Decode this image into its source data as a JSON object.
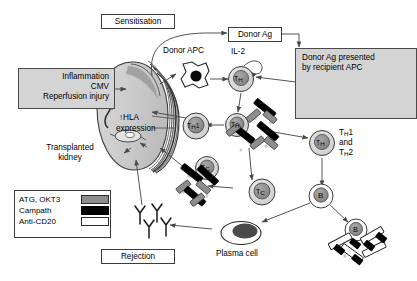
{
  "figure": {
    "type": "biomedical-pathway-diagram"
  },
  "boxes": {
    "sensitisation": {
      "label": "Sensitisation"
    },
    "donor_ag": {
      "label": "Donor Ag"
    },
    "rejection": {
      "label": "Rejection"
    }
  },
  "gray_panels": {
    "stimulus": {
      "line1": "Inflammation",
      "line2": "CMV",
      "line3": "Reperfusion injury"
    },
    "recipient_apc": {
      "line1": "Donor Ag presented",
      "line2": "by recipient APC",
      "icon": "apc-cell-icon"
    }
  },
  "labels": {
    "donor_apc": "Donor APC",
    "il2": "IL-2",
    "hla_up": "↑HLA",
    "hla_expression": "expression",
    "transplanted_kidney_l1": "Transplanted",
    "transplanted_kidney_l2": "kidney",
    "th1_and_th2_l1": "T",
    "th1_and_th2_l1b": "H",
    "th1_and_th2_l1c": "1",
    "th1_and_th2_l2": "and",
    "th1_and_th2_l3": "T",
    "th1_and_th2_l3b": "H",
    "th1_and_th2_l3c": "2",
    "plasma_cell": "Plasma cell"
  },
  "cells": [
    {
      "name": "donor-apc",
      "label": "",
      "kind": "apc"
    },
    {
      "name": "th-il2",
      "label": "TH",
      "kind": "t-helper"
    },
    {
      "name": "th-central",
      "label": "TH",
      "kind": "t-helper"
    },
    {
      "name": "th1",
      "label": "TH1",
      "kind": "t-helper"
    },
    {
      "name": "th-right",
      "label": "TH",
      "kind": "t-helper"
    },
    {
      "name": "tc-left",
      "label": "TC",
      "kind": "t-cytotoxic"
    },
    {
      "name": "tc-center",
      "label": "TC",
      "kind": "t-cytotoxic"
    },
    {
      "name": "b-cell-upper",
      "label": "B",
      "kind": "b-cell"
    },
    {
      "name": "b-cell-lower",
      "label": "B",
      "kind": "b-cell"
    },
    {
      "name": "plasma-cell",
      "label": "",
      "kind": "plasma"
    }
  ],
  "legend": {
    "items": [
      {
        "label": "ATG, OKT3",
        "swatch": "gray",
        "color": "#8e8e8e"
      },
      {
        "label": "Campath",
        "swatch": "black",
        "color": "#000000"
      },
      {
        "label": "Anti-CD20",
        "swatch": "white",
        "color": "#ffffff"
      }
    ]
  },
  "colors": {
    "panel_fill": "#d4d4d4",
    "cell_cytoplasm": "#d9d9d9",
    "cell_nucleus": "#8f8f8f",
    "drug_gray": "#8e8e8e",
    "drug_black": "#000000",
    "drug_white": "#ffffff",
    "stroke": "#3b3b3b",
    "kidney_fill": "#d2d2d2"
  }
}
